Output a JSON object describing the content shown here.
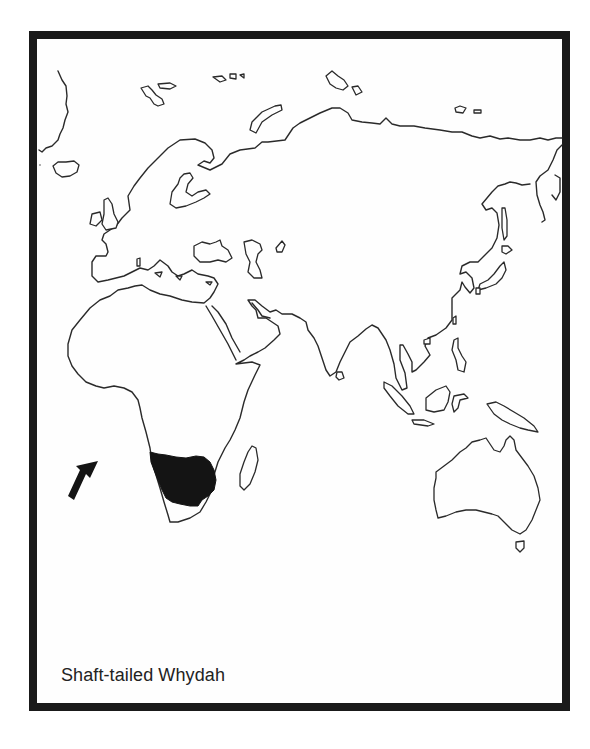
{
  "map": {
    "title": "Shaft-tailed Whydah",
    "projection": "Eastern Hemisphere (Europe, Africa, Asia, Australia)",
    "range_region": "Southern Africa (Namibia, Botswana, South Africa interior)",
    "range_color": "#141414",
    "outline_color": "#2a2a2a",
    "frame_color": "#1a1a1a",
    "background_color": "#ffffff",
    "pointer": {
      "icon": "arrow-icon",
      "direction": "north-east",
      "points_to": "range area / southern Africa"
    }
  }
}
